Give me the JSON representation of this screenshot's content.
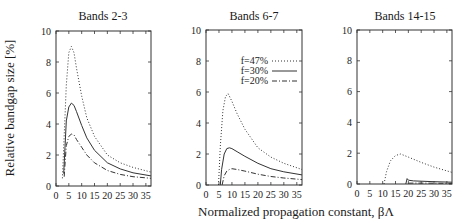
{
  "chart_data": [
    {
      "type": "line",
      "title": "Bands 2-3",
      "xlabel": "Normalized propagation constant, βΛ",
      "ylabel": "Relative bandgap size [%]",
      "xlim": [
        0,
        37
      ],
      "ylim": [
        0,
        10
      ],
      "xticks": [
        0,
        5,
        10,
        15,
        20,
        25,
        30,
        35
      ],
      "yticks": [
        0,
        2,
        4,
        6,
        8,
        10
      ],
      "grid": false,
      "series": [
        {
          "name": "f=47%",
          "style": "dotted",
          "x": [
            2.5,
            3,
            4,
            5,
            6,
            7,
            8,
            10,
            12,
            15,
            20,
            25,
            30,
            37
          ],
          "y": [
            0.5,
            2.5,
            6.5,
            8.6,
            9.0,
            8.6,
            7.6,
            5.8,
            4.4,
            3.2,
            2.0,
            1.5,
            1.2,
            0.9
          ]
        },
        {
          "name": "f=30%",
          "style": "solid",
          "x": [
            3,
            3.5,
            4,
            5,
            6,
            7,
            8,
            10,
            12,
            15,
            20,
            25,
            30,
            37
          ],
          "y": [
            0.8,
            2.5,
            4.2,
            5.1,
            5.35,
            5.2,
            4.8,
            3.9,
            3.1,
            2.3,
            1.5,
            1.1,
            0.85,
            0.65
          ]
        },
        {
          "name": "f=20%",
          "style": "dash-dot",
          "x": [
            3.2,
            3.6,
            4,
            5,
            6,
            7,
            8,
            10,
            12,
            15,
            20,
            25,
            30,
            37
          ],
          "y": [
            0.6,
            1.6,
            2.6,
            3.2,
            3.35,
            3.3,
            3.0,
            2.5,
            2.0,
            1.5,
            1.0,
            0.75,
            0.6,
            0.5
          ]
        }
      ]
    },
    {
      "type": "line",
      "title": "Bands 6-7",
      "xlabel": "Normalized propagation constant, βΛ",
      "ylabel": "",
      "xlim": [
        0,
        37
      ],
      "ylim": [
        0,
        10
      ],
      "xticks": [
        0,
        5,
        10,
        15,
        20,
        25,
        30,
        35
      ],
      "yticks": [
        0,
        2,
        4,
        6,
        8,
        10
      ],
      "grid": false,
      "legend": {
        "position": "upper right",
        "entries": [
          "f=47%",
          "f=30%",
          "f=20%"
        ]
      },
      "series": [
        {
          "name": "f=47%",
          "style": "dotted",
          "x": [
            4.8,
            5.5,
            6.5,
            7.5,
            8.5,
            10,
            12,
            15,
            20,
            25,
            30,
            37
          ],
          "y": [
            0,
            2.5,
            4.8,
            5.7,
            5.9,
            5.4,
            4.6,
            3.6,
            2.4,
            1.8,
            1.4,
            1.0
          ]
        },
        {
          "name": "f=30%",
          "style": "solid",
          "x": [
            5.5,
            6,
            7,
            8,
            9,
            10,
            12,
            15,
            20,
            25,
            30,
            37
          ],
          "y": [
            0,
            1.0,
            2.0,
            2.35,
            2.4,
            2.35,
            2.15,
            1.85,
            1.4,
            1.05,
            0.85,
            0.65
          ]
        },
        {
          "name": "f=20%",
          "style": "dash-dot",
          "x": [
            6.2,
            7,
            8,
            9,
            10,
            12,
            15,
            20,
            25,
            30,
            37
          ],
          "y": [
            0,
            0.6,
            0.9,
            1.0,
            1.05,
            1.0,
            0.9,
            0.7,
            0.55,
            0.45,
            0.35
          ]
        }
      ]
    },
    {
      "type": "line",
      "title": "Bands 14-15",
      "xlabel": "Normalized propagation constant, βΛ",
      "ylabel": "",
      "xlim": [
        0,
        37
      ],
      "ylim": [
        0,
        10
      ],
      "xticks": [
        0,
        5,
        10,
        15,
        20,
        25,
        30,
        35
      ],
      "yticks": [
        0,
        2,
        4,
        6,
        8,
        10
      ],
      "grid": false,
      "series": [
        {
          "name": "f=47%",
          "style": "dotted",
          "x": [
            10.5,
            11.5,
            13,
            15,
            17,
            20,
            25,
            30,
            37
          ],
          "y": [
            0,
            0.8,
            1.5,
            1.85,
            1.95,
            1.75,
            1.4,
            1.1,
            0.75
          ]
        },
        {
          "name": "f=30%",
          "style": "solid",
          "x": [
            19,
            19.5,
            20,
            22,
            25,
            30,
            37
          ],
          "y": [
            0,
            0.35,
            0.25,
            0.2,
            0.18,
            0.15,
            0.12
          ]
        },
        {
          "name": "f=20%",
          "style": "dash-dot",
          "x": [
            20,
            22,
            25,
            30,
            37
          ],
          "y": [
            0.05,
            0.06,
            0.06,
            0.05,
            0.04
          ]
        }
      ]
    }
  ],
  "labels": {
    "titles": [
      "Bands 2-3",
      "Bands 6-7",
      "Bands 14-15"
    ],
    "xlabel": "Normalized propagation constant, βΛ",
    "ylabel": "Relative bandgap size [%]",
    "legend": [
      "f=47%",
      "f=30%",
      "f=20%"
    ]
  }
}
